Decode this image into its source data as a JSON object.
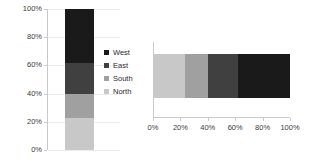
{
  "chart_data": [
    {
      "type": "bar",
      "subtype": "stacked-100-vertical",
      "title": "",
      "xlabel": "",
      "ylabel": "",
      "categories": [
        "Series 1"
      ],
      "series": [
        {
          "name": "North",
          "values": [
            23
          ],
          "color": "#c8c8c8"
        },
        {
          "name": "South",
          "values": [
            17
          ],
          "color": "#a0a0a0"
        },
        {
          "name": "East",
          "values": [
            22
          ],
          "color": "#404040"
        },
        {
          "name": "West",
          "values": [
            38
          ],
          "color": "#1a1a1a"
        }
      ],
      "ylim": [
        0,
        100
      ],
      "yticks": [
        "0%",
        "20%",
        "40%",
        "60%",
        "80%",
        "100%"
      ],
      "ytick_values": [
        0,
        20,
        40,
        60,
        80,
        100
      ],
      "grid": true,
      "legend_position": "right",
      "legend_order": [
        "West",
        "East",
        "South",
        "North"
      ]
    },
    {
      "type": "bar",
      "subtype": "stacked-100-horizontal",
      "title": "",
      "xlabel": "",
      "ylabel": "",
      "categories": [
        "Series 1"
      ],
      "series": [
        {
          "name": "North",
          "values": [
            23
          ],
          "color": "#c8c8c8"
        },
        {
          "name": "South",
          "values": [
            17
          ],
          "color": "#a0a0a0"
        },
        {
          "name": "East",
          "values": [
            22
          ],
          "color": "#404040"
        },
        {
          "name": "West",
          "values": [
            38
          ],
          "color": "#1a1a1a"
        }
      ],
      "xlim": [
        0,
        100
      ],
      "xticks": [
        "0%",
        "20%",
        "40%",
        "60%",
        "80%",
        "100%"
      ],
      "xtick_values": [
        0,
        20,
        40,
        60,
        80,
        100
      ],
      "grid": false,
      "legend_position": "none"
    }
  ],
  "vertical_chart": {
    "y_axis": {
      "labels": [
        "100%",
        "80%",
        "60%",
        "40%",
        "20%",
        "0%"
      ]
    },
    "segments": [
      {
        "name": "West",
        "percent": 38,
        "color": "#1a1a1a"
      },
      {
        "name": "East",
        "percent": 22,
        "color": "#404040"
      },
      {
        "name": "South",
        "percent": 17,
        "color": "#a0a0a0"
      },
      {
        "name": "North",
        "percent": 23,
        "color": "#c8c8c8"
      }
    ]
  },
  "legend": {
    "items": [
      {
        "label": "West",
        "color": "#1a1a1a"
      },
      {
        "label": "East",
        "color": "#404040"
      },
      {
        "label": "South",
        "color": "#a0a0a0"
      },
      {
        "label": "North",
        "color": "#c8c8c8"
      }
    ]
  },
  "horizontal_chart": {
    "x_axis": {
      "labels": [
        "0%",
        "20%",
        "40%",
        "60%",
        "80%",
        "100%"
      ]
    },
    "segments": [
      {
        "name": "North",
        "percent": 23,
        "color": "#c8c8c8"
      },
      {
        "name": "South",
        "percent": 17,
        "color": "#a0a0a0"
      },
      {
        "name": "East",
        "percent": 22,
        "color": "#404040"
      },
      {
        "name": "West",
        "percent": 38,
        "color": "#1a1a1a"
      }
    ]
  }
}
